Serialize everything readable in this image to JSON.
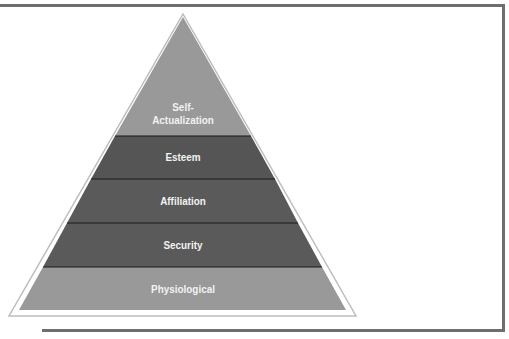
{
  "diagram": {
    "type": "pyramid",
    "title": "",
    "levels": [
      {
        "label": "Self-\nActualization",
        "line1": "Self-",
        "line2": "Actualization",
        "color": "#999999"
      },
      {
        "label": "Esteem",
        "color": "#555555"
      },
      {
        "label": "Affiliation",
        "color": "#5a5a5a"
      },
      {
        "label": "Security",
        "color": "#5a5a5a"
      },
      {
        "label": "Physiological",
        "color": "#999999"
      }
    ],
    "outline_color": "#c8c8c8",
    "frame_color": "#6e6e6e"
  }
}
